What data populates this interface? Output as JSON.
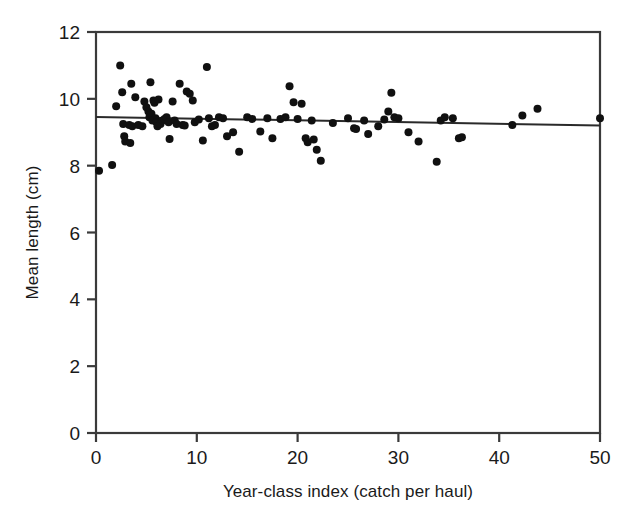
{
  "chart_data": {
    "type": "scatter",
    "title": "",
    "xlabel": "Year-class index (catch per haul)",
    "ylabel": "Mean length (cm)",
    "xlim": [
      0,
      50
    ],
    "ylim": [
      0,
      12
    ],
    "xticks": [
      0,
      10,
      20,
      30,
      40,
      50
    ],
    "yticks": [
      0,
      2,
      4,
      6,
      8,
      10,
      12
    ],
    "xtick_labels": [
      "0",
      "10",
      "20",
      "30",
      "40",
      "50"
    ],
    "ytick_labels": [
      "0",
      "2",
      "4",
      "6",
      "8",
      "10",
      "12"
    ],
    "grid": false,
    "legend": null,
    "marker": {
      "shape": "circle",
      "color": "#101010",
      "size": 8
    },
    "series": [
      {
        "name": "Mean length vs year-class index",
        "points": [
          [
            0.3,
            7.85
          ],
          [
            1.6,
            8.02
          ],
          [
            2.0,
            9.78
          ],
          [
            2.4,
            11.0
          ],
          [
            2.6,
            10.2
          ],
          [
            2.7,
            9.25
          ],
          [
            2.8,
            8.88
          ],
          [
            2.9,
            8.72
          ],
          [
            3.3,
            9.22
          ],
          [
            3.4,
            8.68
          ],
          [
            3.5,
            10.45
          ],
          [
            3.6,
            9.18
          ],
          [
            3.9,
            10.05
          ],
          [
            4.2,
            9.22
          ],
          [
            4.6,
            9.18
          ],
          [
            4.8,
            9.92
          ],
          [
            5.0,
            9.75
          ],
          [
            5.2,
            9.62
          ],
          [
            5.3,
            9.45
          ],
          [
            5.4,
            10.5
          ],
          [
            5.5,
            9.55
          ],
          [
            5.6,
            9.35
          ],
          [
            5.7,
            9.95
          ],
          [
            5.8,
            9.88
          ],
          [
            5.9,
            9.42
          ],
          [
            6.0,
            9.3
          ],
          [
            6.1,
            9.18
          ],
          [
            6.2,
            9.98
          ],
          [
            6.4,
            9.25
          ],
          [
            6.6,
            9.35
          ],
          [
            6.8,
            9.4
          ],
          [
            7.0,
            9.45
          ],
          [
            7.2,
            9.3
          ],
          [
            7.3,
            8.8
          ],
          [
            7.6,
            9.92
          ],
          [
            7.8,
            9.35
          ],
          [
            8.0,
            9.25
          ],
          [
            8.3,
            10.45
          ],
          [
            8.6,
            9.22
          ],
          [
            8.8,
            9.2
          ],
          [
            9.0,
            10.22
          ],
          [
            9.3,
            10.15
          ],
          [
            9.6,
            9.95
          ],
          [
            9.8,
            9.3
          ],
          [
            10.2,
            9.38
          ],
          [
            10.6,
            8.75
          ],
          [
            11.0,
            10.95
          ],
          [
            11.2,
            9.42
          ],
          [
            11.5,
            9.18
          ],
          [
            11.8,
            9.22
          ],
          [
            12.2,
            9.45
          ],
          [
            12.6,
            9.42
          ],
          [
            13.0,
            8.88
          ],
          [
            13.6,
            9.0
          ],
          [
            14.2,
            8.42
          ],
          [
            15.0,
            9.45
          ],
          [
            15.5,
            9.4
          ],
          [
            16.3,
            9.02
          ],
          [
            17.0,
            9.42
          ],
          [
            17.5,
            8.82
          ],
          [
            18.3,
            9.4
          ],
          [
            18.8,
            9.45
          ],
          [
            19.2,
            10.38
          ],
          [
            19.6,
            9.9
          ],
          [
            20.0,
            9.4
          ],
          [
            20.4,
            9.85
          ],
          [
            20.8,
            8.82
          ],
          [
            21.0,
            8.7
          ],
          [
            21.4,
            9.35
          ],
          [
            21.6,
            8.78
          ],
          [
            21.9,
            8.48
          ],
          [
            22.3,
            8.15
          ],
          [
            23.5,
            9.28
          ],
          [
            25.0,
            9.42
          ],
          [
            25.6,
            9.12
          ],
          [
            25.8,
            9.1
          ],
          [
            26.6,
            9.35
          ],
          [
            27.0,
            8.95
          ],
          [
            28.0,
            9.18
          ],
          [
            28.6,
            9.38
          ],
          [
            29.0,
            9.62
          ],
          [
            29.3,
            10.18
          ],
          [
            29.6,
            9.45
          ],
          [
            30.0,
            9.42
          ],
          [
            31.0,
            9.0
          ],
          [
            32.0,
            8.72
          ],
          [
            33.8,
            8.12
          ],
          [
            34.2,
            9.35
          ],
          [
            34.6,
            9.45
          ],
          [
            35.4,
            9.42
          ],
          [
            36.0,
            8.82
          ],
          [
            36.3,
            8.85
          ],
          [
            41.3,
            9.22
          ],
          [
            42.3,
            9.5
          ],
          [
            43.8,
            9.7
          ],
          [
            50.0,
            9.42
          ]
        ]
      }
    ],
    "trend_line": {
      "name": "linear regression fit",
      "x_start": 0,
      "y_start": 9.46,
      "x_end": 50,
      "y_end": 9.2,
      "color": "#2a2a2a"
    }
  }
}
